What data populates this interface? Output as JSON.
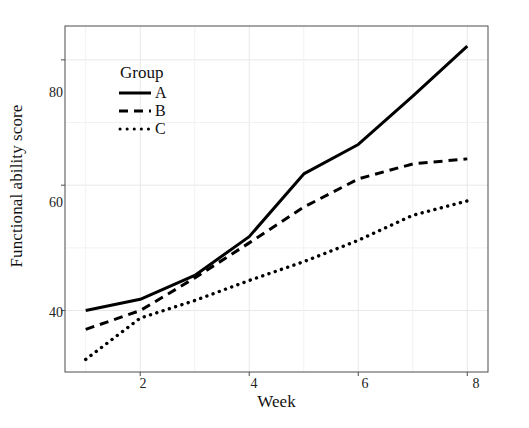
{
  "chart_data": {
    "type": "line",
    "title": "",
    "xlabel": "Week",
    "ylabel": "Functional ability score",
    "x": [
      1,
      2,
      3,
      4,
      5,
      6,
      7,
      8
    ],
    "xlim": [
      0.62,
      8.38
    ],
    "ylim": [
      30.2,
      85.4
    ],
    "xticks": [
      2,
      4,
      6,
      8
    ],
    "yticks": [
      40,
      60,
      80
    ],
    "grid": true,
    "legend_title": "Group",
    "legend_position": "inside-top-left",
    "series": [
      {
        "name": "A",
        "linestyle": "solid",
        "color": "#000000",
        "values": [
          40.0,
          41.8,
          45.6,
          51.8,
          61.8,
          66.5,
          74.2,
          82.2
        ]
      },
      {
        "name": "B",
        "linestyle": "dashed",
        "color": "#000000",
        "values": [
          37.0,
          40.0,
          45.2,
          50.8,
          56.5,
          61.0,
          63.4,
          64.2
        ]
      },
      {
        "name": "C",
        "linestyle": "dotted",
        "color": "#000000",
        "values": [
          32.2,
          38.8,
          41.6,
          44.8,
          47.8,
          51.2,
          55.2,
          57.5
        ]
      }
    ]
  },
  "axis": {
    "ytick_labels": [
      "80",
      "60",
      "40"
    ],
    "xtick_labels": [
      "2",
      "4",
      "6",
      "8"
    ]
  },
  "legend": {
    "title": "Group",
    "entries": [
      {
        "label": "A",
        "style": "solid"
      },
      {
        "label": "B",
        "style": "dashed"
      },
      {
        "label": "C",
        "style": "dotted"
      }
    ]
  },
  "colors": {
    "panel_border": "#4d4d4d",
    "gridline": "#e8e8e8",
    "line": "#000000",
    "background": "#ffffff"
  }
}
